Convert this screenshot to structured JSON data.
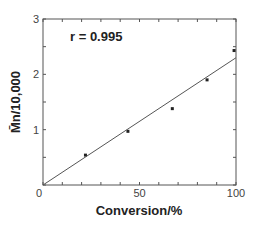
{
  "chart_data": {
    "type": "scatter",
    "title": "",
    "xlabel": "Conversion/%",
    "ylabel": "M̄n/10,000",
    "xlim": [
      0,
      100
    ],
    "ylim": [
      0,
      3
    ],
    "x_ticks": [
      0,
      50,
      100
    ],
    "x_tick_labels": [
      "0",
      "50",
      "100"
    ],
    "x_minor_step": 10,
    "y_ticks": [
      0,
      1,
      2,
      3
    ],
    "y_tick_labels": [
      "0",
      "1",
      "2",
      "3"
    ],
    "y_minor_step": 0.5,
    "grid": false,
    "legend": null,
    "series": [
      {
        "name": "data",
        "kind": "points",
        "x": [
          22,
          44,
          67,
          85,
          99
        ],
        "y": [
          0.54,
          0.97,
          1.38,
          1.9,
          2.43
        ]
      },
      {
        "name": "linear fit",
        "kind": "line",
        "x": [
          0,
          100
        ],
        "y": [
          0,
          2.3
        ]
      }
    ],
    "annotations": [
      {
        "text": "r = 0.995",
        "x": 14,
        "y": 2.6
      }
    ]
  },
  "colors": {
    "axis": "#555555",
    "line": "#555555",
    "points": "#222222",
    "background": "#ffffff"
  }
}
